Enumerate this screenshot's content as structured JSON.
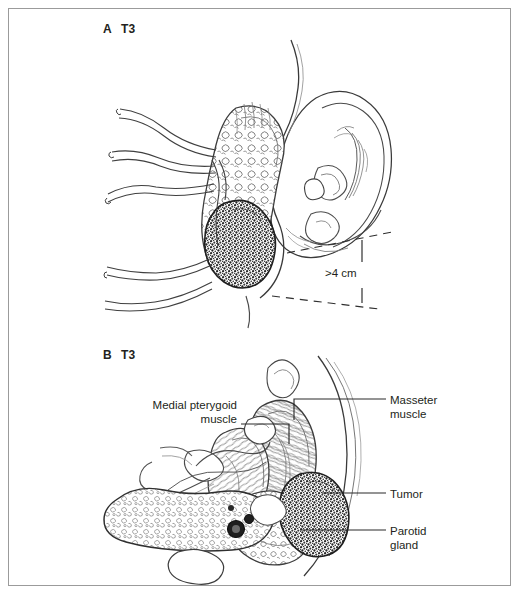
{
  "figure": {
    "background_color": "#ffffff",
    "border_color": "#9b9b9b",
    "ink_color": "#231f20",
    "panels": [
      {
        "id": "A",
        "letter": "A",
        "stage": "T3",
        "description": "Lateral view of head showing ear, parotid gland, facial nerve branches and tumor with size measurement"
      },
      {
        "id": "B",
        "letter": "B",
        "stage": "T3",
        "description": "Axial cross-section through the head showing medial pterygoid muscle, masseter muscle, parotid gland and tumor"
      }
    ]
  },
  "panel_a": {
    "letter": "A",
    "stage": "T3",
    "measurement_label": ">4 cm"
  },
  "panel_b": {
    "letter": "B",
    "stage": "T3",
    "annotations": {
      "medial_pterygoid": "Medial pterygoid\nmuscle",
      "masseter": "Masseter\nmuscle",
      "tumor": "Tumor",
      "parotid": "Parotid\ngland"
    }
  }
}
